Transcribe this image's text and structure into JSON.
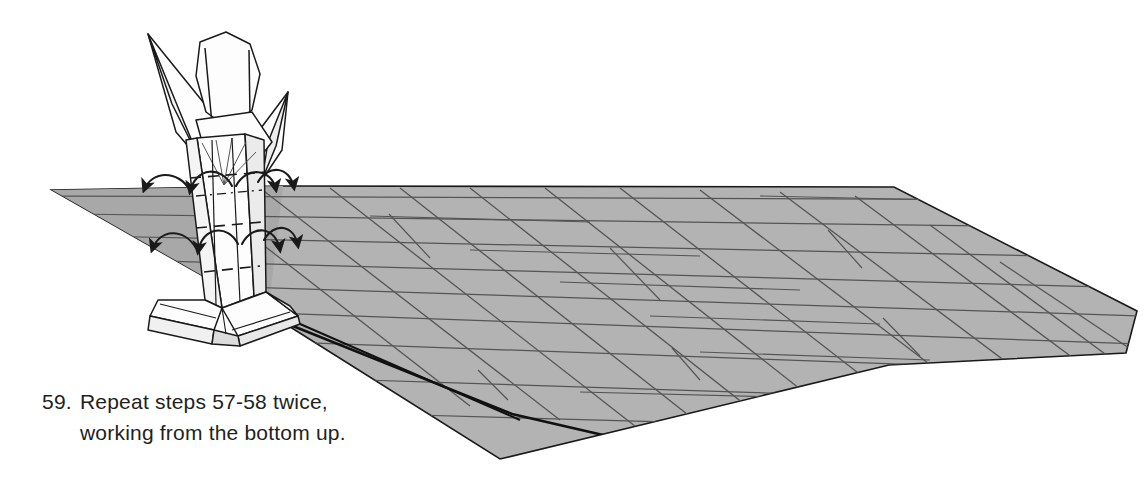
{
  "page": {
    "background_color": "#ffffff",
    "width": 1144,
    "height": 489,
    "kind": "origami-instruction-diagram"
  },
  "caption": {
    "step_number": "59.",
    "line1": "Repeat steps 57-58 twice,",
    "line2": "working from the bottom up.",
    "full_text": "59. Repeat steps 57-58 twice, working from the bottom up.",
    "text_color": "#231f20"
  },
  "colors": {
    "paper_gray": "#b3b3b3",
    "paper_gray_shadow": "#9d9d9d",
    "paper_white": "#fdfdfd",
    "outline": "#1a1a1a",
    "crease_line": "#555555",
    "ink": "#231f20"
  },
  "diagram": {
    "elements": [
      {
        "name": "folded-figure",
        "description": "Partially folded origami model with pointed flaps standing upright"
      },
      {
        "name": "paper-sheet",
        "description": "Large gray quadrilateral sheet with pleat crease lines receding to the right"
      },
      {
        "name": "fold-arrows",
        "description": "Eight curved arrows indicating outward folds on both sides of the stem"
      },
      {
        "name": "valley-fold-lines",
        "description": "Dashed lines marking the valley folds across the stem"
      }
    ],
    "arrow_count": 8,
    "fold_arrow_rows": 2
  },
  "sheet": {
    "name": "paper-sheet",
    "outline_points": "52,190 285,186 893,188 1137,310 1126,352 889,364 500,458 268,312",
    "fill": "#b3b3b3"
  },
  "creases": {
    "horizontal_count": 9,
    "diagonal_count": 12,
    "tick_count": 6
  }
}
